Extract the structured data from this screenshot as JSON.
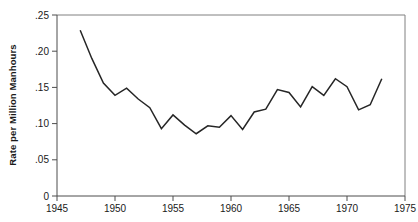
{
  "chart_data": {
    "type": "line",
    "title": "",
    "subtitle": "",
    "xlabel": "",
    "ylabel": "Rate per Million Manhours",
    "xlim": [
      1945,
      1975
    ],
    "ylim": [
      0,
      0.25
    ],
    "grid": false,
    "legend": null,
    "annotations": [],
    "x_ticks": [
      1945,
      1950,
      1955,
      1960,
      1965,
      1970,
      1975
    ],
    "x_tick_labels": [
      "1945",
      "1950",
      "1955",
      "1960",
      "1965",
      "1970",
      "1975"
    ],
    "y_ticks": [
      0,
      0.05,
      0.1,
      0.15,
      0.2,
      0.25
    ],
    "y_tick_labels": [
      "0",
      ".05",
      ".10",
      ".15",
      ".20",
      ".25"
    ],
    "series": [
      {
        "name": "Rate per Million Manhours",
        "color": "#262626",
        "x": [
          1947,
          1948,
          1949,
          1950,
          1951,
          1952,
          1953,
          1954,
          1955,
          1956,
          1957,
          1958,
          1959,
          1960,
          1961,
          1962,
          1963,
          1964,
          1965,
          1966,
          1967,
          1968,
          1969,
          1970,
          1971,
          1972,
          1973
        ],
        "values": [
          0.229,
          0.19,
          0.156,
          0.139,
          0.149,
          0.134,
          0.122,
          0.093,
          0.112,
          0.098,
          0.086,
          0.097,
          0.095,
          0.111,
          0.092,
          0.116,
          0.12,
          0.147,
          0.143,
          0.123,
          0.151,
          0.139,
          0.162,
          0.151,
          0.119,
          0.126,
          0.162
        ]
      }
    ]
  },
  "labels": {
    "y_axis_title": "Rate per Million Manhours"
  }
}
